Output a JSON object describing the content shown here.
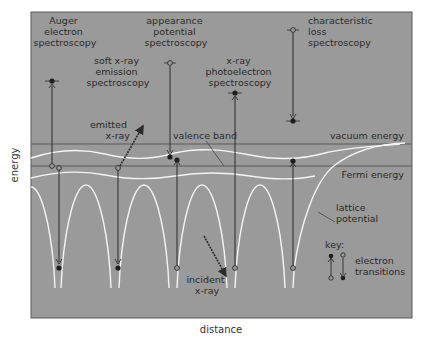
{
  "diagram": {
    "colors": {
      "panel_bg": "#9a9a9a",
      "frame": "#5a5a5a",
      "white_curve": "#f4f4f4",
      "level_line": "#5b5b5b",
      "transition": "#2b2b2b",
      "text": "#2a2a2a",
      "page_bg": "#ffffff"
    },
    "axes": {
      "x_label": "distance",
      "y_label": "energy"
    },
    "techniques": [
      {
        "id": "auger",
        "lines": [
          "Auger",
          "electron",
          "spectroscopy"
        ]
      },
      {
        "id": "appearance",
        "lines": [
          "appearance",
          "potential",
          "spectroscopy"
        ]
      },
      {
        "id": "characteristic",
        "lines": [
          "characteristic",
          "loss",
          "spectroscopy"
        ]
      },
      {
        "id": "soft-xray",
        "lines": [
          "soft x-ray",
          "emission",
          "spectroscopy"
        ]
      },
      {
        "id": "xps",
        "lines": [
          "x-ray",
          "photoelectron",
          "spectroscopy"
        ]
      }
    ],
    "annotations": {
      "emitted_xray": [
        "emitted",
        "x-ray"
      ],
      "incident_xray": [
        "incident",
        "x-ray"
      ],
      "valence_band": "valence band",
      "vacuum_energy": "vacuum energy",
      "fermi_energy": "Fermi energy",
      "lattice_potential": [
        "lattice",
        "potential"
      ]
    },
    "key": {
      "title": "key:",
      "label": [
        "electron",
        "transitions"
      ]
    }
  }
}
